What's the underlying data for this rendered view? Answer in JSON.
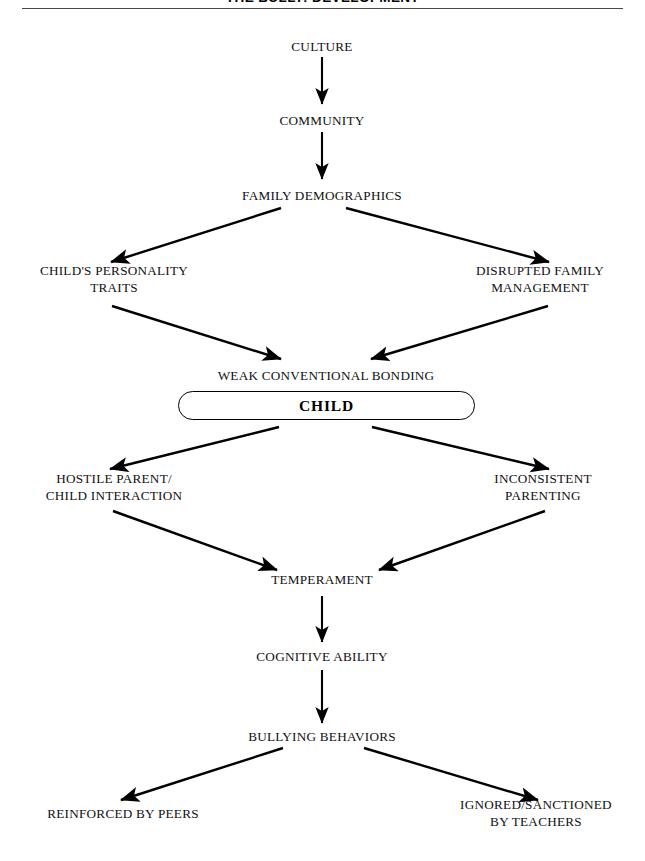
{
  "page": {
    "title": "THE BULLY: DEVELOPMENT",
    "background_color": "#ffffff",
    "ink_color": "#000000",
    "rule_color": "#4a4a4a"
  },
  "diagram": {
    "type": "flowchart",
    "orientation": "top-down",
    "nodes": [
      {
        "id": "culture",
        "label": "CULTURE"
      },
      {
        "id": "community",
        "label": "COMMUNITY"
      },
      {
        "id": "family_demo",
        "label": "FAMILY DEMOGRAPHICS"
      },
      {
        "id": "personality",
        "label": "CHILD'S PERSONALITY\nTRAITS"
      },
      {
        "id": "disrupted",
        "label": "DISRUPTED FAMILY\nMANAGEMENT"
      },
      {
        "id": "weak_bonding",
        "label": "WEAK CONVENTIONAL BONDING"
      },
      {
        "id": "child",
        "label": "CHILD"
      },
      {
        "id": "hostile",
        "label": "HOSTILE PARENT/\nCHILD INTERACTION"
      },
      {
        "id": "inconsistent",
        "label": "INCONSISTENT\nPARENTING"
      },
      {
        "id": "temperament",
        "label": "TEMPERAMENT"
      },
      {
        "id": "cognitive",
        "label": "COGNITIVE ABILITY"
      },
      {
        "id": "bullying",
        "label": "BULLYING BEHAVIORS"
      },
      {
        "id": "reinforced",
        "label": "REINFORCED BY PEERS"
      },
      {
        "id": "ignored",
        "label": "IGNORED/SANCTIONED\nBY TEACHERS"
      }
    ],
    "edges": [
      {
        "from": "culture",
        "to": "community"
      },
      {
        "from": "community",
        "to": "family_demo"
      },
      {
        "from": "family_demo",
        "to": "personality"
      },
      {
        "from": "family_demo",
        "to": "disrupted"
      },
      {
        "from": "personality",
        "to": "weak_bonding"
      },
      {
        "from": "disrupted",
        "to": "weak_bonding"
      },
      {
        "from": "child",
        "to": "hostile"
      },
      {
        "from": "child",
        "to": "inconsistent"
      },
      {
        "from": "hostile",
        "to": "temperament"
      },
      {
        "from": "inconsistent",
        "to": "temperament"
      },
      {
        "from": "temperament",
        "to": "cognitive"
      },
      {
        "from": "cognitive",
        "to": "bullying"
      },
      {
        "from": "bullying",
        "to": "reinforced"
      },
      {
        "from": "bullying",
        "to": "ignored"
      }
    ]
  }
}
